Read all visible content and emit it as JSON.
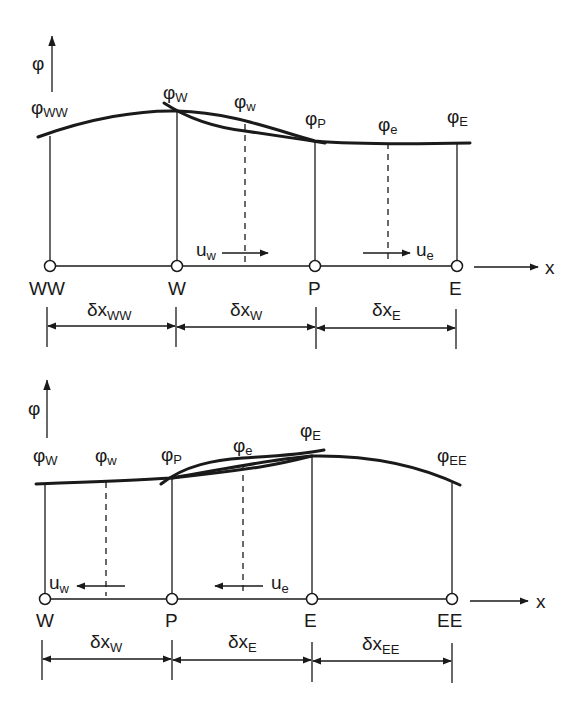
{
  "figure": {
    "top": {
      "axis_label_y": "φ",
      "axis_label_x": "x",
      "nodes": [
        {
          "label": "WW",
          "phi_base": "φ",
          "phi_sub": "WW"
        },
        {
          "label": "W",
          "phi_base": "φ",
          "phi_sub": "W"
        },
        {
          "label": "P",
          "phi_base": "φ",
          "phi_sub": "P"
        },
        {
          "label": "E",
          "phi_base": "φ",
          "phi_sub": "E"
        }
      ],
      "faces": [
        {
          "phi_base": "φ",
          "phi_sub": "w"
        },
        {
          "phi_base": "φ",
          "phi_sub": "e"
        }
      ],
      "velocities": [
        {
          "base": "u",
          "sub": "w",
          "direction": "right"
        },
        {
          "base": "u",
          "sub": "e",
          "direction": "right"
        }
      ],
      "spacings": [
        {
          "base": "δx",
          "sub": "WW"
        },
        {
          "base": "δx",
          "sub": "W"
        },
        {
          "base": "δx",
          "sub": "E"
        }
      ]
    },
    "bottom": {
      "axis_label_y": "φ",
      "axis_label_x": "x",
      "nodes": [
        {
          "label": "W",
          "phi_base": "φ",
          "phi_sub": "W"
        },
        {
          "label": "P",
          "phi_base": "φ",
          "phi_sub": "P"
        },
        {
          "label": "E",
          "phi_base": "φ",
          "phi_sub": "E"
        },
        {
          "label": "EE",
          "phi_base": "φ",
          "phi_sub": "EE"
        }
      ],
      "faces": [
        {
          "phi_base": "φ",
          "phi_sub": "w"
        },
        {
          "phi_base": "φ",
          "phi_sub": "e"
        }
      ],
      "velocities": [
        {
          "base": "u",
          "sub": "w",
          "direction": "left"
        },
        {
          "base": "u",
          "sub": "e",
          "direction": "left"
        }
      ],
      "spacings": [
        {
          "base": "δx",
          "sub": "W"
        },
        {
          "base": "δx",
          "sub": "E"
        },
        {
          "base": "δx",
          "sub": "EE"
        }
      ]
    }
  }
}
